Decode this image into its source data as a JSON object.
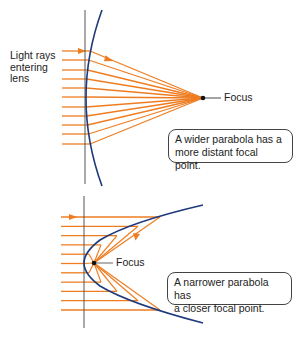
{
  "colors": {
    "ray": "#ee7d22",
    "parabola": "#1f3a7a",
    "axis": "#555555",
    "focus_dot": "#111111"
  },
  "top_panel": {
    "side_label": [
      "Light rays",
      "entering",
      "lens"
    ],
    "focus_label": "Focus",
    "callout": [
      "A wider parabola has a",
      "more distant focal point."
    ]
  },
  "bottom_panel": {
    "focus_label": "Focus",
    "callout": [
      "A narrower parabola has",
      "a closer focal point."
    ]
  }
}
